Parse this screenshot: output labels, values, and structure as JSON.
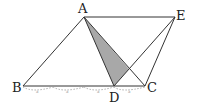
{
  "diagram": {
    "points": {
      "A": {
        "label": "A",
        "x": 84,
        "y": 17
      },
      "E": {
        "label": "E",
        "x": 175,
        "y": 17
      },
      "B": {
        "label": "B",
        "x": 23,
        "y": 86
      },
      "C": {
        "label": "C",
        "x": 145,
        "y": 86
      },
      "D": {
        "label": "D",
        "x": 114,
        "y": 86
      }
    },
    "segments": [
      "AB",
      "BC",
      "AC",
      "AE",
      "EC",
      "AD",
      "DE"
    ],
    "shaded_region": "triangle A-D-(AC∩DE)",
    "shade_color": "#a8a8a8",
    "line_color": "#333333",
    "arc_marks": {
      "label": "a",
      "count": 4,
      "note": "BD divided into 3 equal parts, DC one part"
    }
  }
}
